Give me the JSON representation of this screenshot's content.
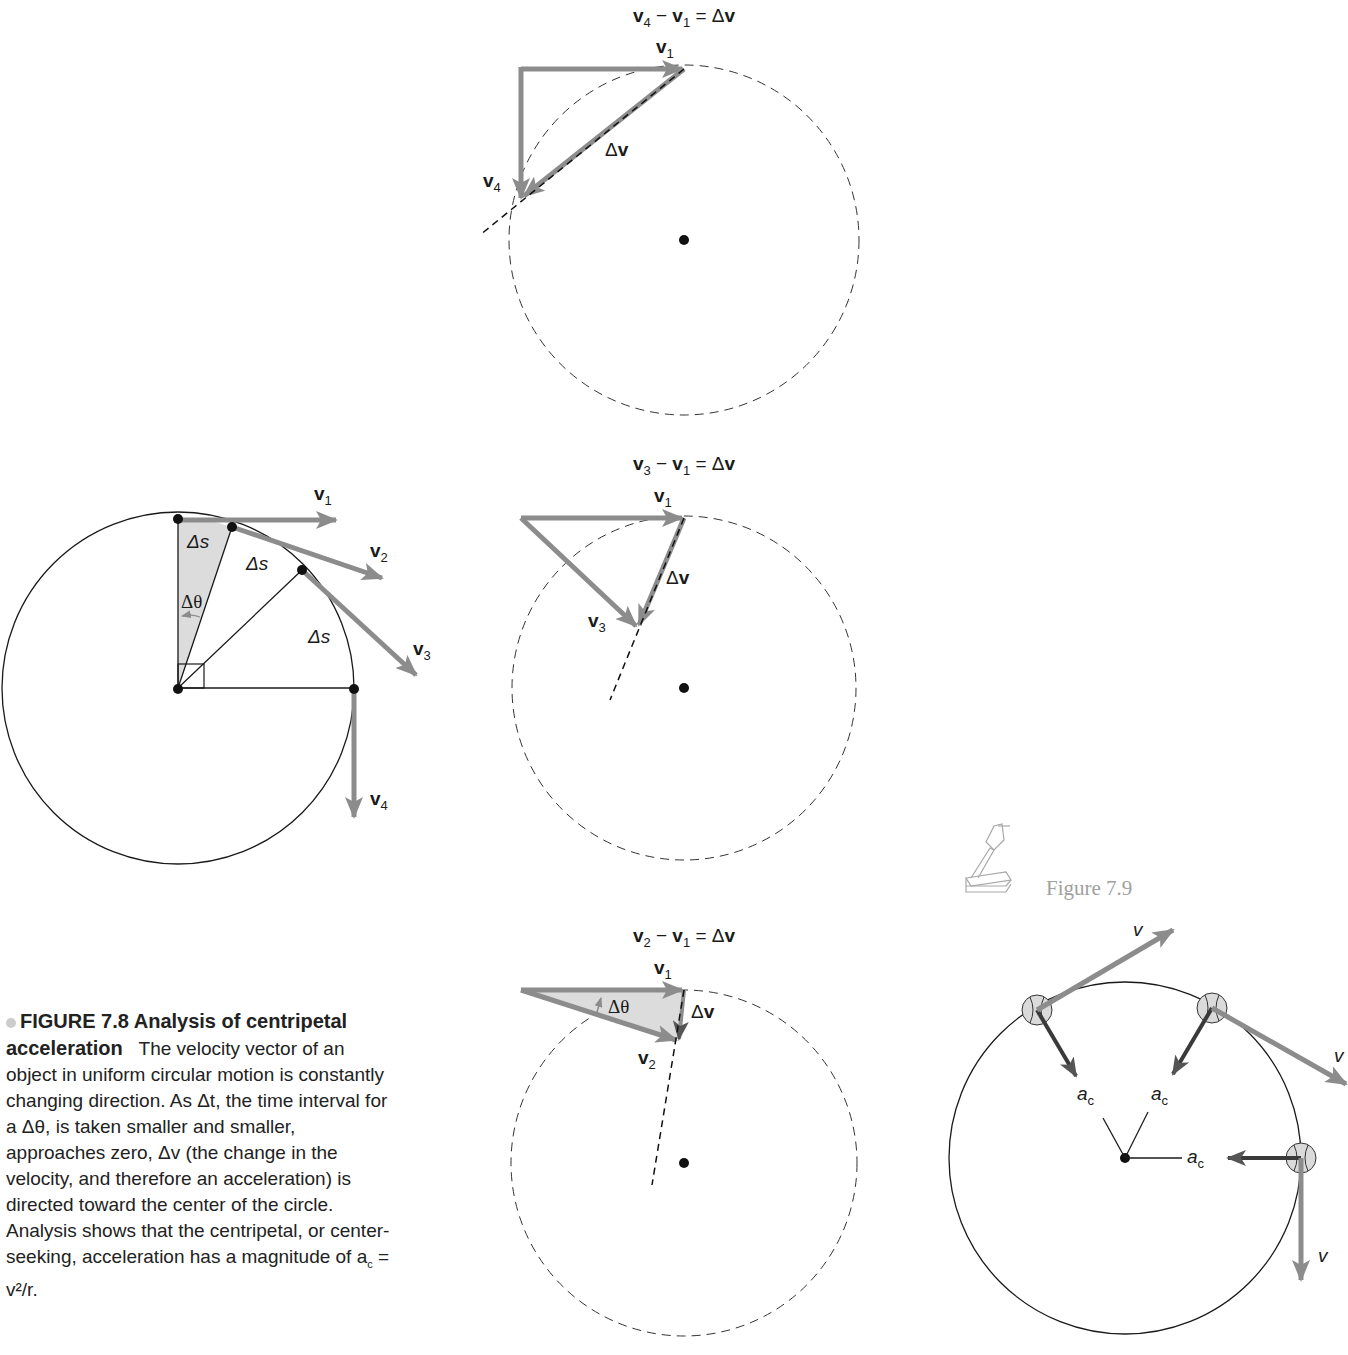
{
  "colors": {
    "vector_arrow": "#8c8c8c",
    "accel_arrow": "#3a3a3a",
    "line": "#1a1a1a",
    "shading": "#dcdcdc",
    "figure_ref_gray": "#a0a0a0"
  },
  "panel_top": {
    "equation": "v₄ − v₁ = Δv",
    "eq_parts": {
      "a": "v",
      "a_sub": "4",
      "op": " − ",
      "b": "v",
      "b_sub": "1",
      "eq": " = Δ",
      "c": "v"
    },
    "label_v1": "v",
    "label_v1_sub": "1",
    "label_v4": "v",
    "label_v4_sub": "4",
    "label_dv_delta": "Δ",
    "label_dv": "v"
  },
  "panel_middle": {
    "eq_parts": {
      "a": "v",
      "a_sub": "3",
      "op": " − ",
      "b": "v",
      "b_sub": "1",
      "eq": " = Δ",
      "c": "v"
    },
    "label_v1": "v",
    "label_v1_sub": "1",
    "label_v3": "v",
    "label_v3_sub": "3",
    "label_dv_delta": "Δ",
    "label_dv": "v"
  },
  "panel_bottom": {
    "eq_parts": {
      "a": "v",
      "a_sub": "2",
      "op": " − ",
      "b": "v",
      "b_sub": "1",
      "eq": " = Δ",
      "c": "v"
    },
    "label_v1": "v",
    "label_v1_sub": "1",
    "label_v2": "v",
    "label_v2_sub": "2",
    "label_dtheta": "Δθ",
    "label_dv_delta": "Δ",
    "label_dv": "v"
  },
  "left_figure": {
    "vectors": [
      {
        "name": "v",
        "sub": "1"
      },
      {
        "name": "v",
        "sub": "2"
      },
      {
        "name": "v",
        "sub": "3"
      },
      {
        "name": "v",
        "sub": "4"
      }
    ],
    "arc_label": "Δs",
    "angle_label": "Δθ"
  },
  "caption": {
    "title": "FIGURE 7.8  Analysis of centripetal acceleration",
    "body": "The velocity vector of an object in uniform circular motion is constantly changing direction. As Δt, the time interval for a Δθ, is taken smaller and smaller, approaches zero, Δv (the change in the velocity, and therefore an acceleration) is directed toward the center of the circle. Analysis shows that the centripetal, or center-seeking, acceleration has a magnitude of a",
    "body_end_sub": "c",
    "body_end": " = v²/r."
  },
  "figure_ref": {
    "label": "Figure 7.9",
    "icon": "overhead-projector-icon"
  },
  "right_figure": {
    "velocity_label": "v",
    "accel_label": "a",
    "accel_sub": "c"
  }
}
